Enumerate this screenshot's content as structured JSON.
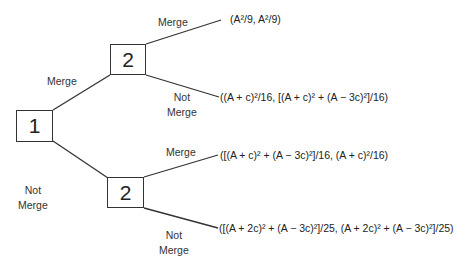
{
  "diagram": {
    "type": "game-tree",
    "nodes": [
      {
        "id": "n1",
        "label": "1"
      },
      {
        "id": "n2_top",
        "label": "2"
      },
      {
        "id": "n2_bottom",
        "label": "2"
      }
    ],
    "edges": [
      {
        "from": "n1",
        "to": "n2_top",
        "label": "Merge"
      },
      {
        "from": "n1",
        "to": "n2_bottom",
        "label_line1": "Not",
        "label_line2": "Merge"
      },
      {
        "from": "n2_top",
        "to": "payoff_1",
        "label": "Merge"
      },
      {
        "from": "n2_top",
        "to": "payoff_2",
        "label_line1": "Not",
        "label_line2": "Merge"
      },
      {
        "from": "n2_bottom",
        "to": "payoff_3",
        "label": "Merge"
      },
      {
        "from": "n2_bottom",
        "to": "payoff_4",
        "label_line1": "Not",
        "label_line2": "Merge"
      }
    ],
    "payoffs": [
      "(A²/9, A²/9)",
      "((A + c)²/16, [(A + c)² + (A − 3c)²]/16)",
      "([(A + c)² + (A − 3c)²]/16, (A + c)²/16)",
      "([(A + 2c)² + (A − 3c)²]/25, (A + 2c)² + (A − 3c)²]/25)"
    ],
    "colors": {
      "line": "#333333",
      "text": "#222222",
      "background": "#ffffff"
    }
  }
}
